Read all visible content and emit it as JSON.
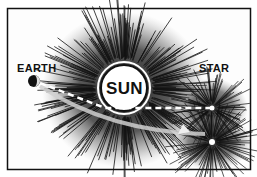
{
  "diagram": {
    "type": "illustration",
    "labels": {
      "earth": "EARTH",
      "sun": "SUN",
      "star": "STAR"
    },
    "objects": [
      {
        "name": "earth",
        "x": 34,
        "y": 81
      },
      {
        "name": "sun",
        "x": 124,
        "y": 88,
        "r": 22
      },
      {
        "name": "apparent-star",
        "x": 212,
        "y": 108
      },
      {
        "name": "actual-star",
        "x": 212,
        "y": 142
      }
    ],
    "colors": {
      "ink": "#111111",
      "paper": "#ffffff"
    }
  }
}
